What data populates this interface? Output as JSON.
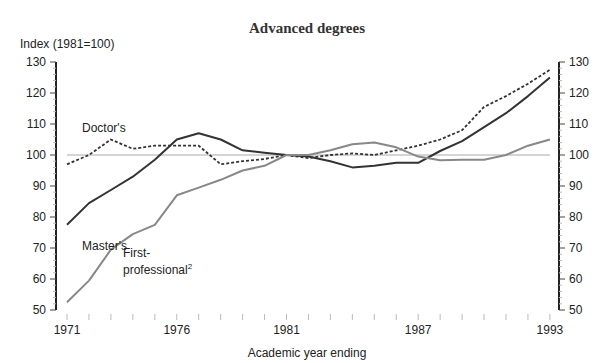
{
  "chart_data": {
    "type": "line",
    "title": "Advanced degrees",
    "ylabel": "Index (1981=100)",
    "xlabel": "Academic year ending",
    "ylim": [
      50,
      130
    ],
    "yticks": [
      50,
      60,
      70,
      80,
      90,
      100,
      110,
      120,
      130
    ],
    "xtick_labels": [
      "1971",
      "1976",
      "1981",
      "1987",
      "1993"
    ],
    "x": [
      1971,
      1972,
      1973,
      1974,
      1975,
      1976,
      1977,
      1978,
      1979,
      1980,
      1981,
      1982,
      1983,
      1984,
      1985,
      1986,
      1987,
      1988,
      1989,
      1990,
      1991,
      1992,
      1993
    ],
    "reference_line": 100,
    "grid": false,
    "series": [
      {
        "name": "Doctor's",
        "style": "dotted",
        "color": "#333333",
        "values": [
          97,
          100,
          105,
          102,
          103,
          103,
          103,
          97,
          98,
          98.7,
          100,
          99,
          100,
          100.5,
          100,
          101.5,
          103,
          105,
          108,
          115.5,
          119,
          123,
          127.5
        ]
      },
      {
        "name": "Master's",
        "style": "solid",
        "color": "#333333",
        "values": [
          77.5,
          84.5,
          88.7,
          93,
          98.5,
          105,
          107,
          105,
          101.5,
          100.7,
          100,
          99.5,
          98,
          96,
          96.5,
          97.5,
          97.5,
          101.3,
          104.5,
          109,
          113.5,
          119,
          125
        ]
      },
      {
        "name": "First-professional²",
        "style": "solid",
        "color": "#888888",
        "values": [
          52.5,
          59.5,
          69.5,
          74.5,
          77.5,
          87,
          89.5,
          92,
          95,
          96.5,
          100,
          100,
          101.5,
          103.5,
          104,
          102.5,
          99.5,
          98.3,
          98.5,
          98.5,
          100,
          103,
          105
        ]
      }
    ],
    "annotations": [
      {
        "text": "Doctor's",
        "near": 1973
      },
      {
        "text": "Master's",
        "near": 1972
      },
      {
        "text": "First-",
        "near": 1974
      },
      {
        "text": "professional",
        "superscript": "2",
        "near": 1974
      }
    ]
  }
}
